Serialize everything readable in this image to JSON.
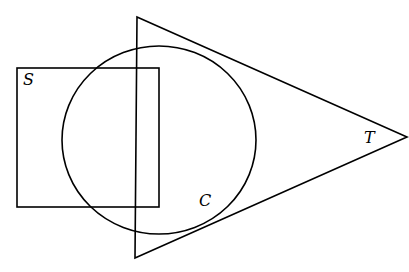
{
  "diagram": {
    "type": "set-overlap",
    "stroke_color": "#000000",
    "background": "#ffffff",
    "shapes": [
      {
        "id": "square",
        "label": "S",
        "kind": "rectangle",
        "x": 17,
        "y": 68,
        "width": 142,
        "height": 139
      },
      {
        "id": "circle",
        "label": "C",
        "kind": "ellipse",
        "cx": 159,
        "cy": 140,
        "rx": 97,
        "ry": 94
      },
      {
        "id": "triangle",
        "label": "T",
        "kind": "triangle",
        "points": [
          [
            137,
            17
          ],
          [
            407,
            137
          ],
          [
            135,
            258
          ]
        ]
      }
    ],
    "labels": {
      "square": "S",
      "circle": "C",
      "triangle": "T"
    }
  }
}
